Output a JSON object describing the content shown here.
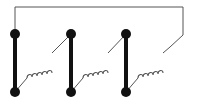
{
  "diagram": {
    "type": "circuit-schematic",
    "colors": {
      "background": "#ffffff",
      "wire": "#555555",
      "node": "#111111"
    },
    "top_wire_y": 7,
    "right_wire_x": 183,
    "node_radius": 5,
    "columns": [
      {
        "id": "conductor-1",
        "x": 15,
        "top_y": 34,
        "bottom_y": 92
      },
      {
        "id": "conductor-2",
        "x": 71,
        "top_y": 34,
        "bottom_y": 92
      },
      {
        "id": "conductor-3",
        "x": 126,
        "top_y": 34,
        "bottom_y": 92
      }
    ],
    "coils": [
      {
        "id": "coil-1",
        "from": "conductor-1 bottom",
        "to": "conductor-2 top"
      },
      {
        "id": "coil-2",
        "from": "conductor-2 bottom",
        "to": "conductor-3 top"
      },
      {
        "id": "coil-3",
        "from": "conductor-3 bottom",
        "to": "right return wire"
      }
    ]
  }
}
